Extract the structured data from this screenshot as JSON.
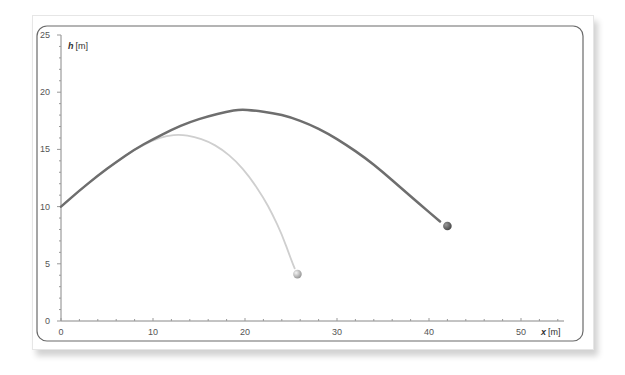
{
  "chart_data": {
    "type": "line",
    "title": "",
    "xlabel_var": "x",
    "xlabel_unit": "[m]",
    "ylabel_var": "h",
    "ylabel_unit": "[m]",
    "xlim": [
      0,
      55
    ],
    "ylim": [
      0,
      25
    ],
    "x_ticks": [
      0,
      10,
      20,
      30,
      40,
      50
    ],
    "y_ticks": [
      0,
      5,
      10,
      15,
      20,
      25
    ],
    "grid": false,
    "legend": null,
    "series": [
      {
        "name": "trajectory-high",
        "color": "#6e6e6e",
        "width": 2.5,
        "points": [
          [
            0,
            10
          ],
          [
            2,
            11.4
          ],
          [
            4,
            12.7
          ],
          [
            6,
            13.9
          ],
          [
            8,
            15.0
          ],
          [
            10,
            15.9
          ],
          [
            12,
            16.7
          ],
          [
            14,
            17.4
          ],
          [
            16,
            17.9
          ],
          [
            18,
            18.3
          ],
          [
            19.5,
            18.5
          ],
          [
            21,
            18.4
          ],
          [
            23,
            18.2
          ],
          [
            25,
            17.8
          ],
          [
            27,
            17.2
          ],
          [
            29,
            16.4
          ],
          [
            31,
            15.4
          ],
          [
            33,
            14.3
          ],
          [
            35,
            13.0
          ],
          [
            37,
            11.6
          ],
          [
            39,
            10.2
          ],
          [
            41.2,
            8.7
          ]
        ],
        "end_marker": [
          42,
          8.3
        ]
      },
      {
        "name": "trajectory-low",
        "color": "#cfcfcf",
        "width": 1.8,
        "points": [
          [
            0,
            10
          ],
          [
            2,
            11.4
          ],
          [
            4,
            12.7
          ],
          [
            6,
            13.9
          ],
          [
            8,
            15.0
          ],
          [
            10,
            15.8
          ],
          [
            11.5,
            16.2
          ],
          [
            13,
            16.3
          ],
          [
            14.5,
            16.1
          ],
          [
            16,
            15.7
          ],
          [
            17.5,
            15.0
          ],
          [
            19,
            14.0
          ],
          [
            20.5,
            12.6
          ],
          [
            22,
            10.8
          ],
          [
            23,
            9.3
          ],
          [
            24,
            7.6
          ],
          [
            25,
            5.4
          ],
          [
            25.4,
            4.6
          ]
        ],
        "end_marker": [
          25.7,
          4.1
        ]
      }
    ]
  }
}
